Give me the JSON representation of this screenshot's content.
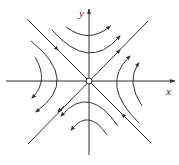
{
  "diagram": {
    "type": "phase-portrait",
    "axes": {
      "x_label": "x",
      "y_label": "y"
    },
    "origin_marker": "open-circle",
    "colors": {
      "line": "#333333",
      "background": "#ffffff"
    },
    "separatrices": [
      {
        "name": "stable-manifold",
        "direction": "inward",
        "from": "top-left",
        "to": "bottom-right"
      },
      {
        "name": "unstable-manifold",
        "direction": "outward",
        "from": "bottom-left",
        "to": "top-right"
      }
    ],
    "trajectories": [
      {
        "region": "top",
        "count": 2,
        "flow": "left-to-right"
      },
      {
        "region": "bottom",
        "count": 2,
        "flow": "right-to-left"
      },
      {
        "region": "left",
        "count": 2,
        "flow": "top-to-bottom"
      },
      {
        "region": "right",
        "count": 2,
        "flow": "bottom-to-top"
      }
    ]
  }
}
